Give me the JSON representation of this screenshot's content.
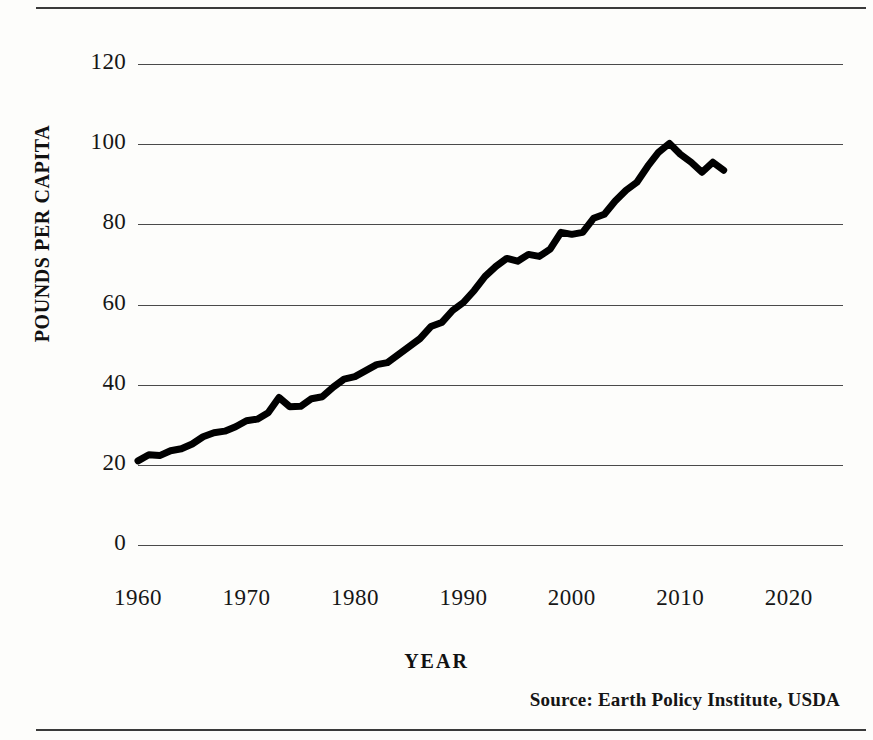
{
  "figure": {
    "source_note": "Source: Earth Policy Institute, USDA"
  },
  "chart_data": {
    "type": "line",
    "title": "",
    "xlabel": "YEAR",
    "ylabel": "POUNDS PER CAPITA",
    "xlim": [
      1960,
      2025
    ],
    "ylim": [
      0,
      120
    ],
    "grid": true,
    "legend": "none",
    "line_color": "#000000",
    "line_width": 7,
    "xticks": [
      1960,
      1970,
      1980,
      1990,
      2000,
      2010,
      2020
    ],
    "xtick_labels": [
      "1960",
      "1970",
      "1980",
      "1990",
      "2000",
      "2010",
      "2020"
    ],
    "yticks": [
      0,
      20,
      40,
      60,
      80,
      100,
      120
    ],
    "ytick_labels": [
      "0",
      "20",
      "40",
      "60",
      "80",
      "100",
      "120"
    ],
    "series": [
      {
        "name": "Chicken consumption",
        "x": [
          1960,
          1961,
          1962,
          1963,
          1964,
          1965,
          1966,
          1967,
          1968,
          1969,
          1970,
          1971,
          1972,
          1973,
          1974,
          1975,
          1976,
          1977,
          1978,
          1979,
          1980,
          1981,
          1982,
          1983,
          1984,
          1985,
          1986,
          1987,
          1988,
          1989,
          1990,
          1991,
          1992,
          1993,
          1994,
          1995,
          1996,
          1997,
          1998,
          1999,
          2000,
          2001,
          2002,
          2003,
          2004,
          2005,
          2006,
          2007,
          2008,
          2009,
          2010,
          2011,
          2012,
          2013,
          2014
        ],
        "y": [
          21.0,
          22.5,
          22.3,
          23.5,
          24.0,
          25.2,
          27.0,
          28.0,
          28.4,
          29.5,
          31.0,
          31.4,
          33.0,
          36.8,
          34.5,
          34.6,
          36.5,
          37.0,
          39.4,
          41.4,
          42.0,
          43.5,
          45.0,
          45.5,
          47.5,
          49.5,
          51.5,
          54.5,
          55.5,
          58.5,
          60.5,
          63.5,
          67.0,
          69.5,
          71.5,
          70.8,
          72.5,
          72.0,
          73.8,
          78.0,
          77.5,
          78.0,
          81.5,
          82.5,
          85.8,
          88.5,
          90.5,
          94.5,
          98.0,
          100.2,
          97.5,
          95.5,
          93.0,
          95.5,
          93.5
        ]
      }
    ]
  },
  "axis": {
    "y_title": "POUNDS PER CAPITA",
    "x_title": "YEAR"
  }
}
